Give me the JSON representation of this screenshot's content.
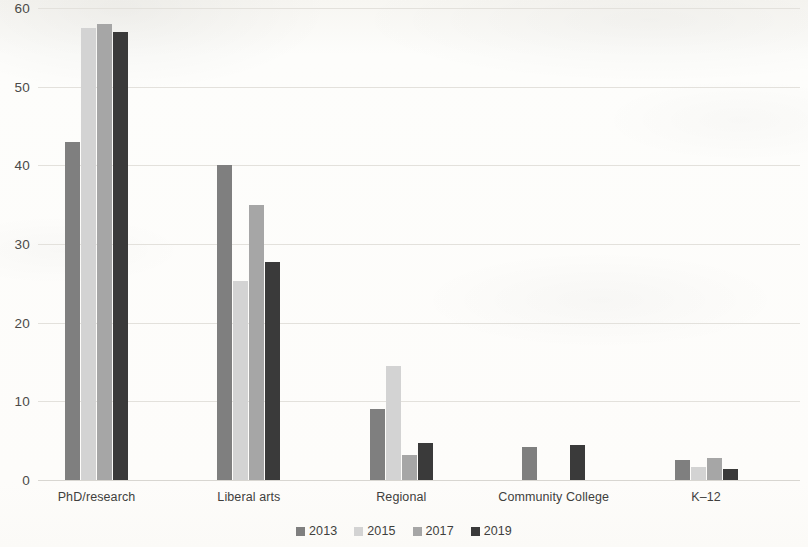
{
  "chart_data": {
    "type": "bar",
    "title": "",
    "subtitle": "",
    "xlabel": "",
    "ylabel": "",
    "ylim": [
      0,
      60
    ],
    "yticks": [
      0,
      10,
      20,
      30,
      40,
      50,
      60
    ],
    "ytick_labels": [
      "0",
      "10",
      "20",
      "30",
      "40",
      "50",
      "60"
    ],
    "grid": true,
    "grid_axis": "y",
    "legend_position": "bottom-center",
    "categories": [
      "PhD/research",
      "Liberal arts",
      "Regional",
      "Community College",
      "K–12"
    ],
    "series": [
      {
        "name": "2013",
        "color": "#7f7f7f",
        "values": [
          43.0,
          40.0,
          9.0,
          4.2,
          2.5
        ]
      },
      {
        "name": "2015",
        "color": "#d3d3d3",
        "values": [
          57.4,
          25.3,
          14.5,
          null,
          1.6
        ]
      },
      {
        "name": "2017",
        "color": "#a6a6a6",
        "values": [
          58.0,
          35.0,
          3.2,
          null,
          2.8
        ]
      },
      {
        "name": "2019",
        "color": "#3a3a3a",
        "values": [
          57.0,
          27.7,
          4.7,
          4.5,
          1.4
        ]
      }
    ]
  },
  "legend": {
    "items": [
      {
        "label": "2013",
        "color": "#7f7f7f"
      },
      {
        "label": "2015",
        "color": "#d3d3d3"
      },
      {
        "label": "2017",
        "color": "#a6a6a6"
      },
      {
        "label": "2019",
        "color": "#3a3a3a"
      }
    ]
  },
  "colors": {
    "background": "#fdfdfb",
    "gridline": "#e3e1dc",
    "text": "#3f3f3d",
    "axis_text": "#4a4a48"
  }
}
